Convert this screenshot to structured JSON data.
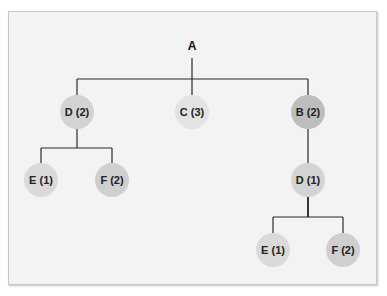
{
  "diagram": {
    "type": "tree",
    "root": {
      "id": "A",
      "label": "A"
    },
    "nodes": [
      {
        "id": "D2",
        "label": "D (2)",
        "parent": "A",
        "fill": "#d3d3d3"
      },
      {
        "id": "C3",
        "label": "C (3)",
        "parent": "A",
        "fill": "#e3e3e3"
      },
      {
        "id": "B2",
        "label": "B (2)",
        "parent": "A",
        "fill": "#bdbdbd"
      },
      {
        "id": "E1a",
        "label": "E (1)",
        "parent": "D2",
        "fill": "#dadada"
      },
      {
        "id": "F2a",
        "label": "F (2)",
        "parent": "D2",
        "fill": "#cfcfcf"
      },
      {
        "id": "D1",
        "label": "D (1)",
        "parent": "B2",
        "fill": "#d3d3d3"
      },
      {
        "id": "E1b",
        "label": "E (1)",
        "parent": "D1",
        "fill": "#dadada"
      },
      {
        "id": "F2b",
        "label": "F (2)",
        "parent": "D1",
        "fill": "#cfcfcf"
      }
    ]
  }
}
